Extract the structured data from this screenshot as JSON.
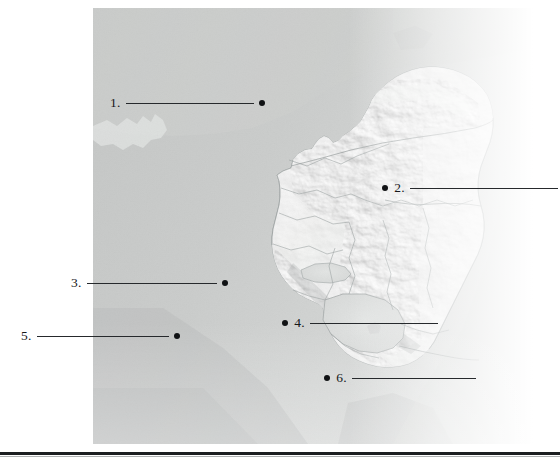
{
  "page": {
    "kind": "map-quiz",
    "background_color": "#ffffff",
    "width": 560,
    "height": 470
  },
  "map": {
    "name": "nicaragua-shaded-relief",
    "description": "Unlabeled shaded-relief quiz map of Nicaragua with Pacific and Caribbean coasts, Lake Nicaragua, Lake Managua and internal departmental boundaries",
    "frame": {
      "x": 93,
      "y": 8,
      "width": 440,
      "height": 436
    },
    "colors": {
      "ocean": "#c6c8c7",
      "ocean_light": "#d6d8d7",
      "land": "#e8e9e8",
      "land_shadow": "#b9bbba",
      "lake": "#dcdedd",
      "border_line": "#9aa0a0",
      "coast_line": "#8e9494",
      "fade_white": "#ffffff"
    }
  },
  "annotations": [
    {
      "id": 1,
      "label": "1.",
      "dot_side": "right",
      "num_x": 110,
      "num_y": 96,
      "line_x": 128,
      "line_y": 103,
      "line_w": 128,
      "dot_x": 260,
      "dot_y": 100
    },
    {
      "id": 2,
      "label": "2.",
      "dot_side": "left",
      "num_x": 394,
      "num_y": 181,
      "line_x": 412,
      "line_y": 188,
      "line_w": 148,
      "dot_x": 384,
      "dot_y": 185
    },
    {
      "id": 3,
      "label": "3.",
      "dot_side": "right",
      "num_x": 71,
      "num_y": 276,
      "line_x": 89,
      "line_y": 283,
      "line_w": 130,
      "dot_x": 222,
      "dot_y": 280
    },
    {
      "id": 4,
      "label": "4.",
      "dot_side": "left",
      "num_x": 294,
      "num_y": 316,
      "line_x": 312,
      "line_y": 323,
      "line_w": 128,
      "dot_x": 284,
      "dot_y": 320
    },
    {
      "id": 5,
      "label": "5.",
      "dot_side": "right",
      "num_x": 21,
      "num_y": 329,
      "line_x": 39,
      "line_y": 336,
      "line_w": 132,
      "dot_x": 173,
      "dot_y": 333
    },
    {
      "id": 6,
      "label": "6.",
      "dot_side": "left",
      "num_x": 336,
      "num_y": 371,
      "line_x": 354,
      "line_y": 378,
      "line_w": 124,
      "dot_x": 326,
      "dot_y": 375
    }
  ],
  "footer": {
    "rule_color": "#1c1f21",
    "rule_y": 452,
    "rule_thickness": 3
  }
}
